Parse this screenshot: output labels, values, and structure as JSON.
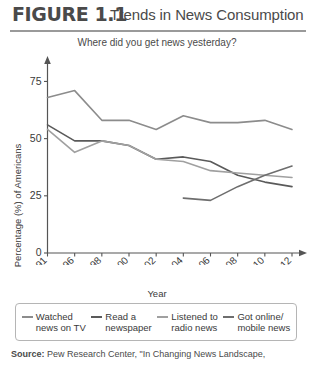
{
  "figure": {
    "number": "FIGURE 1.1",
    "title": "Trends in News Consumption"
  },
  "source": {
    "prefix": "Source:",
    "text": " Pew Research Center, \"In Changing News Landscape,"
  },
  "chart_data": {
    "type": "line",
    "title": "Where did you get news yesterday?",
    "xlabel": "Year",
    "ylabel": "Percentage (%) of Americans",
    "x": [
      1991,
      1996,
      1998,
      2000,
      2002,
      2004,
      2006,
      2008,
      2010,
      2012
    ],
    "xticklabels": [
      "1991",
      "1996",
      "1998",
      "2000",
      "2002",
      "2004",
      "2006",
      "2008",
      "2010",
      "2012"
    ],
    "yticklabels": [
      "0",
      "25",
      "50",
      "75"
    ],
    "yticks": [
      0,
      25,
      50,
      75
    ],
    "ylim": [
      0,
      80
    ],
    "grid": false,
    "legend_position": "bottom",
    "series": [
      {
        "name": "Watched\nnews on TV",
        "label": "Watched news on TV",
        "color": "#8c8c8c",
        "x": [
          1991,
          1996,
          1998,
          2000,
          2002,
          2004,
          2006,
          2008,
          2010,
          2012
        ],
        "values": [
          68,
          71,
          58,
          58,
          54,
          60,
          57,
          57,
          58,
          54
        ]
      },
      {
        "name": "Read a\nnewspaper",
        "label": "Read a newspaper",
        "color": "#5a5a5a",
        "x": [
          1991,
          1996,
          1998,
          2000,
          2002,
          2004,
          2006,
          2008,
          2010,
          2012
        ],
        "values": [
          56,
          49,
          49,
          47,
          41,
          42,
          40,
          34,
          31,
          29
        ]
      },
      {
        "name": "Listened to\nradio news",
        "label": "Listened to radio news",
        "color": "#a0a0a0",
        "x": [
          1991,
          1996,
          1998,
          2000,
          2002,
          2004,
          2006,
          2008,
          2010,
          2012
        ],
        "values": [
          54,
          44,
          49,
          47,
          41,
          40,
          36,
          35,
          34,
          33
        ]
      },
      {
        "name": "Got online/\nmobile news",
        "label": "Got online/mobile news",
        "color": "#6e6e6e",
        "x": [
          2004,
          2006,
          2008,
          2010,
          2012
        ],
        "values": [
          24,
          23,
          29,
          34,
          38
        ]
      }
    ]
  }
}
